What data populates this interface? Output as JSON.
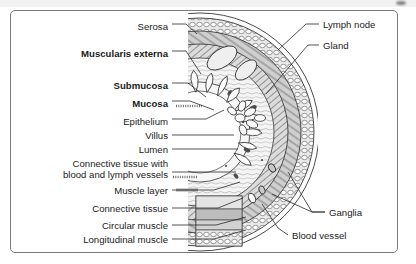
{
  "figure": {
    "background": "#ffffff",
    "frame_color": "#7b7b7b",
    "ink_color": "#1b1b1b"
  },
  "labels_left": [
    {
      "id": "serosa",
      "text": "Serosa",
      "bold": false,
      "x_right": 168,
      "y": 27,
      "leader_to": [
        196,
        32
      ]
    },
    {
      "id": "muscularis-externa",
      "text": "Muscularis externa",
      "bold": true,
      "x_right": 168,
      "y": 54,
      "leader_to": [
        199,
        72
      ]
    },
    {
      "id": "submucosa",
      "text": "Submucosa",
      "bold": true,
      "x_right": 168,
      "y": 86,
      "leader_to": [
        205,
        96
      ]
    },
    {
      "id": "mucosa",
      "text": "Mucosa",
      "bold": true,
      "x_right": 168,
      "y": 104,
      "leader_to": [
        213,
        110
      ]
    },
    {
      "id": "epithelium",
      "text": "Epithelium",
      "bold": false,
      "x_right": 168,
      "y": 122,
      "leader_to": [
        222,
        112
      ]
    },
    {
      "id": "villus",
      "text": "Villus",
      "bold": false,
      "x_right": 168,
      "y": 138,
      "leader_to": [
        232,
        137
      ]
    },
    {
      "id": "lumen",
      "text": "Lumen",
      "bold": false,
      "x_right": 168,
      "y": 152,
      "leader_to": [
        236,
        152
      ]
    },
    {
      "id": "muscle-layer",
      "text": "Muscle layer",
      "bold": false,
      "x_right": 168,
      "y": 193,
      "leader_to": [
        238,
        186
      ]
    },
    {
      "id": "connective-tissue",
      "text": "Connective tissue",
      "bold": false,
      "x_right": 168,
      "y": 211,
      "leader_to": [
        241,
        201
      ]
    },
    {
      "id": "circular-muscle",
      "text": "Circular muscle",
      "bold": false,
      "x_right": 168,
      "y": 228,
      "leader_to": [
        243,
        221
      ]
    },
    {
      "id": "longitudinal-muscle",
      "text": "Longitudinal muscle",
      "bold": false,
      "x_right": 168,
      "y": 242,
      "leader_to": [
        243,
        234
      ]
    }
  ],
  "label_connective_multiline": {
    "id": "connective-tissue-vessels",
    "line1": "Connective tissue with",
    "line2": "blood and lymph vessels",
    "x_right": 168,
    "y": 164,
    "leader_to": [
      236,
      180
    ]
  },
  "labels_right": [
    {
      "id": "lymph-node",
      "text": "Lymph node",
      "x_left": 323,
      "y": 27,
      "leader_to": [
        279,
        48
      ]
    },
    {
      "id": "gland",
      "text": "Gland",
      "x_left": 323,
      "y": 48,
      "leader_to": [
        268,
        92
      ]
    },
    {
      "id": "ganglia",
      "text": "Ganglia",
      "x_left": 329,
      "y": 215,
      "leader_to": [
        289,
        170
      ]
    },
    {
      "id": "blood-vessel",
      "text": "Blood vessel",
      "x_left": 292,
      "y": 238,
      "leader_to": [
        280,
        205
      ]
    }
  ],
  "ganglia_second_leader_to": [
    276,
    196
  ],
  "illustration": {
    "name": "intestine-cross-section",
    "center_x": 200,
    "center_y": 132,
    "description": "Concentric arcs of gut wall with villi lining the lumen, lymph node, gland, ganglia and blood vessel",
    "layer_rings": [
      {
        "name": "serosa-outer",
        "r": 118,
        "stroke": "#4a4a4a",
        "fill": "none"
      },
      {
        "name": "longitudinal-muscle",
        "r": 112,
        "stroke": "#3d3d3d",
        "fill": "#d9d9d9"
      },
      {
        "name": "circular-muscle",
        "r": 100,
        "stroke": "#3d3d3d",
        "fill": "#c7c7c7"
      },
      {
        "name": "submucosa",
        "r": 84,
        "stroke": "#4a4a4a",
        "fill": "#f0f0f0"
      },
      {
        "name": "mucosa",
        "r": 62,
        "stroke": "#4a4a4a",
        "fill": "#e6e6e6"
      },
      {
        "name": "lumen",
        "r": 40,
        "stroke": "#4a4a4a",
        "fill": "#ffffff"
      }
    ],
    "villi_count": 15,
    "cutaway_panel": {
      "x": 196,
      "y": 196,
      "w": 46,
      "h": 50
    }
  }
}
